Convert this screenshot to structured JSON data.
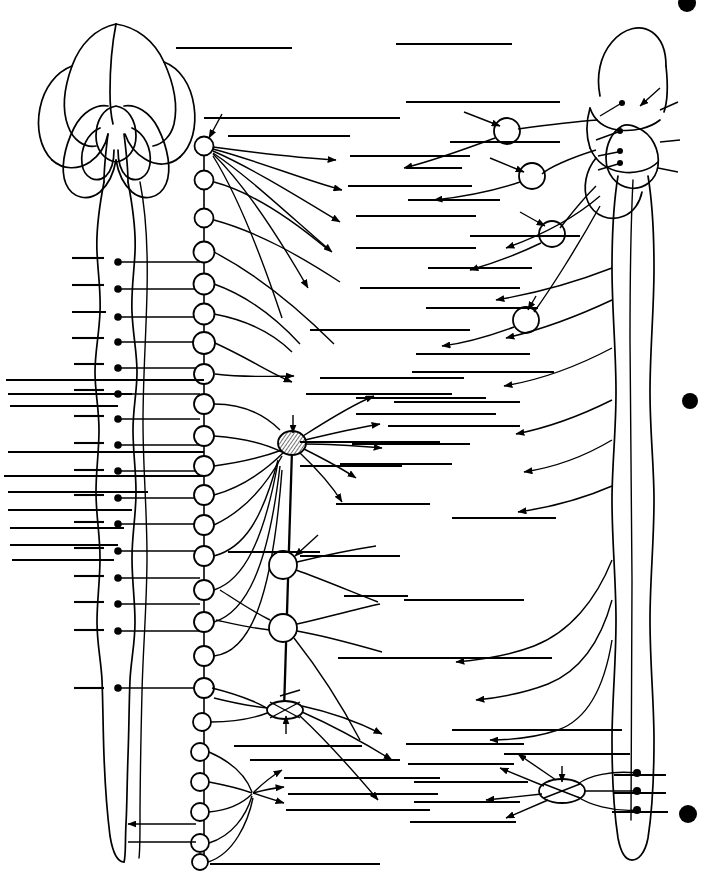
{
  "figure": {
    "subtitle": "Unlabeled study figure: sympathetic and parasympathetic divisions",
    "background_color": "#ffffff",
    "ink_color": "#000000",
    "width": 712,
    "height": 877,
    "visible_text": "",
    "note": "No text labels are printed on this figure; all label positions are blank ruled leader lines."
  },
  "left_panel": {
    "name": "brain-and-spinal-cord",
    "brain": {
      "name": "brain-dorsal-view",
      "description": "Cerebral hemispheres with cerebellum, dorsal view, brainstem descending"
    },
    "spinal_cord": {
      "name": "spinal-cord",
      "description": "Long spinal cord with cervical and lumbar enlargements and conus medullaris",
      "preganglionic_soma_count": 16
    }
  },
  "sympathetic_chain": {
    "name": "sympathetic-trunk",
    "ganglion_count": 23,
    "description": "Paravertebral sympathetic chain ganglia linked by interganglionic trunk"
  },
  "prevertebral_ganglia": [
    {
      "name": "celiac-ganglion",
      "style": "hatched",
      "cx": 292,
      "cy": 443,
      "rx": 13,
      "ry": 11
    },
    {
      "name": "superior-mesenteric-ganglion",
      "style": "plain",
      "cx": 283,
      "cy": 565,
      "rx": 14,
      "ry": 14
    },
    {
      "name": "inferior-mesenteric-ganglion",
      "style": "plain",
      "cx": 283,
      "cy": 628,
      "rx": 14,
      "ry": 14
    },
    {
      "name": "hypogastric-plexus-ganglion",
      "style": "ellipse",
      "cx": 285,
      "cy": 710,
      "rx": 18,
      "ry": 9
    },
    {
      "name": "pelvic-ganglion",
      "style": "ellipse",
      "cx": 562,
      "cy": 791,
      "rx": 22,
      "ry": 12
    }
  ],
  "cranial_ganglia": [
    {
      "name": "ciliary-ganglion",
      "cx": 507,
      "cy": 131,
      "r": 13
    },
    {
      "name": "pterygopalatine-ganglion",
      "cx": 532,
      "cy": 176,
      "r": 13
    },
    {
      "name": "submandibular-ganglion",
      "cx": 552,
      "cy": 234,
      "r": 13
    },
    {
      "name": "otic-ganglion",
      "cx": 526,
      "cy": 320,
      "r": 13
    }
  ],
  "right_panel": {
    "name": "brainstem-lateral-view",
    "description": "Brainstem and sacral cord shown in lateral view with cranial nerve roots"
  },
  "page_markers": [
    {
      "name": "page-marker-dot-top",
      "cx": 687,
      "cy": 3,
      "r": 9
    },
    {
      "name": "page-marker-dot-middle",
      "cx": 690,
      "cy": 401,
      "r": 8
    },
    {
      "name": "page-marker-dot-bottom",
      "cx": 688,
      "cy": 814,
      "r": 9
    }
  ],
  "label_lines": {
    "name": "blank-label-leader-lines",
    "total": 64,
    "left_margin_lines": 12,
    "left_short_lines": 16,
    "right_lines": 36
  }
}
